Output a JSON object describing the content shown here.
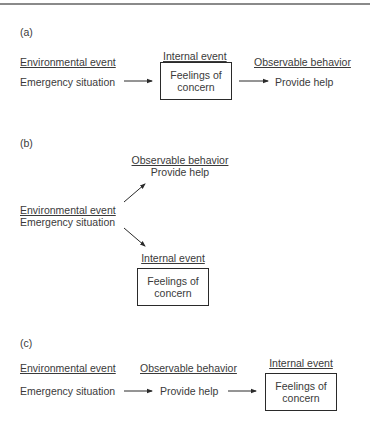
{
  "panels": {
    "a": {
      "label": "(a)",
      "headers": {
        "environmental": "Environmental event",
        "internal": "Internal event",
        "observable": "Observable behavior"
      },
      "environmental_value": "Emergency situation",
      "internal_box": {
        "line1": "Feelings of",
        "line2": "concern"
      },
      "observable_value": "Provide help"
    },
    "b": {
      "label": "(b)",
      "headers": {
        "environmental": "Environmental event",
        "internal": "Internal event",
        "observable": "Observable behavior"
      },
      "environmental_value": "Emergency situation",
      "internal_box": {
        "line1": "Feelings of",
        "line2": "concern"
      },
      "observable_value": "Provide help"
    },
    "c": {
      "label": "(c)",
      "headers": {
        "environmental": "Environmental event",
        "observable": "Observable behavior",
        "internal": "Internal event"
      },
      "environmental_value": "Emergency situation",
      "observable_value": "Provide help",
      "internal_box": {
        "line1": "Feelings of",
        "line2": "concern"
      }
    }
  },
  "colors": {
    "text": "#3a3a3a",
    "lines": "#2a2a2a",
    "top_rule": "#8a8a8a"
  }
}
